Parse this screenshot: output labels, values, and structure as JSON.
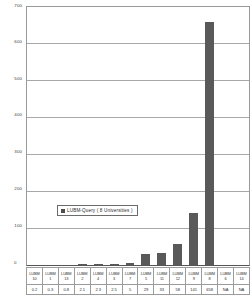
{
  "chart_data": {
    "type": "bar",
    "title": "",
    "xlabel": "",
    "ylabel": "",
    "ylim": [
      0,
      700
    ],
    "grid": true,
    "legend_position": "center",
    "legend": [
      "LUBM-Query ( 8 Universities )"
    ],
    "y_ticks": [
      "700",
      "600",
      "500",
      "400",
      "300",
      "200",
      "100",
      "0"
    ],
    "y_tick_values": [
      700,
      600,
      500,
      400,
      300,
      200,
      100,
      0
    ],
    "categories": [
      "LUBM 10",
      "LUBM 1",
      "LUBM 13",
      "LUBM 2",
      "LUBM 4",
      "LUBM 3",
      "LUBM 7",
      "LUBM 5",
      "LUBM 11",
      "LUBM 12",
      "LUBM 9",
      "LUBM 8",
      "LUBM 6",
      "LUBM 14"
    ],
    "category_prefixes": [
      "LUBM",
      "LUBM",
      "LUBM",
      "LUBM",
      "LUBM",
      "LUBM",
      "LUBM",
      "LUBM",
      "LUBM",
      "LUBM",
      "LUBM",
      "LUBM",
      "LUBM",
      "LUBM"
    ],
    "category_numbers": [
      "10",
      "1",
      "13",
      "2",
      "4",
      "3",
      "7",
      "5",
      "11",
      "12",
      "9",
      "8",
      "6",
      "14"
    ],
    "value_labels": [
      "0.2",
      "0.3",
      "0.8",
      "2.1",
      "2.3",
      "2.5",
      "5",
      "29",
      "33",
      "58",
      "141",
      "658",
      "NA",
      "NA"
    ],
    "values": [
      0.2,
      0.3,
      0.8,
      2.1,
      2.3,
      2.5,
      5,
      29,
      33,
      58,
      141,
      658,
      null,
      null
    ],
    "series": [
      {
        "name": "LUBM-Query ( 8 Universities )",
        "values": [
          0.2,
          0.3,
          0.8,
          2.1,
          2.3,
          2.5,
          5,
          29,
          33,
          58,
          141,
          658,
          null,
          null
        ]
      }
    ]
  },
  "colors": {
    "bar": "#595959",
    "legend_swatch": "#4d4d4d",
    "gridline": "#a8a8a8",
    "axis": "#555555",
    "plot_border": "#9a9a9a",
    "table_border": "#9b9b9b",
    "text": "#2f2f2f",
    "background": "#ffffff"
  }
}
